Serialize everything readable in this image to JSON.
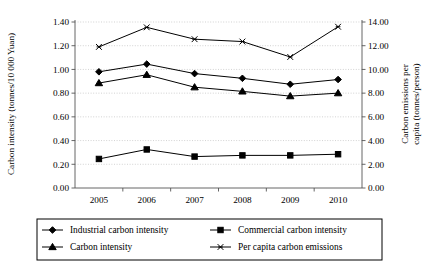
{
  "chart_data": {
    "type": "line",
    "title": "",
    "subtitle": "",
    "xlabel": "",
    "categories": [
      "2005",
      "2006",
      "2007",
      "2008",
      "2009",
      "2010"
    ],
    "x": [
      2005,
      2006,
      2007,
      2008,
      2009,
      2010
    ],
    "grid": true,
    "legend_position": "bottom",
    "axes": {
      "left": {
        "label": "Carbon intensity (tonnes/10 000 Yuan)",
        "ylim": [
          0.0,
          1.4
        ],
        "tick_step": 0.2,
        "ticks": [
          "0.00",
          "0.20",
          "0.40",
          "0.60",
          "0.80",
          "1.00",
          "1.20",
          "1.40"
        ],
        "tick_values": [
          0.0,
          0.2,
          0.4,
          0.6,
          0.8,
          1.0,
          1.2,
          1.4
        ]
      },
      "right": {
        "label": "Carbon emissions per capita (tonnes/person)",
        "ylim": [
          0.0,
          14.0
        ],
        "tick_step": 2.0,
        "ticks": [
          "0.00",
          "2.00",
          "4.00",
          "6.00",
          "8.00",
          "10.00",
          "12.00",
          "14.00"
        ],
        "tick_values": [
          0.0,
          2.0,
          4.0,
          6.0,
          8.0,
          10.0,
          12.0,
          14.0
        ]
      }
    },
    "series": [
      {
        "name": "Industrial carbon intensity",
        "marker": "diamond",
        "axis": "left",
        "values": [
          0.98,
          1.045,
          0.965,
          0.925,
          0.875,
          0.915
        ]
      },
      {
        "name": "Commercial carbon intensity",
        "marker": "square",
        "axis": "left",
        "values": [
          0.245,
          0.325,
          0.265,
          0.275,
          0.275,
          0.285
        ]
      },
      {
        "name": "Carbon intensity",
        "marker": "triangle",
        "axis": "left",
        "values": [
          0.885,
          0.955,
          0.85,
          0.815,
          0.775,
          0.8
        ]
      },
      {
        "name": "Per capita carbon emissions",
        "marker": "cross",
        "axis": "right",
        "values": [
          11.9,
          13.55,
          12.55,
          12.35,
          11.05,
          13.6
        ]
      }
    ],
    "colors": {
      "series": "#000000",
      "grid": "#bfbfbf",
      "axis": "#555555",
      "background": "#ffffff"
    }
  },
  "legend": {
    "entries": [
      {
        "label": "Industrial carbon intensity",
        "marker": "diamond"
      },
      {
        "label": "Commercial carbon intensity",
        "marker": "square"
      },
      {
        "label": "Carbon intensity",
        "marker": "triangle"
      },
      {
        "label": "Per capita carbon emissions",
        "marker": "cross"
      }
    ]
  }
}
